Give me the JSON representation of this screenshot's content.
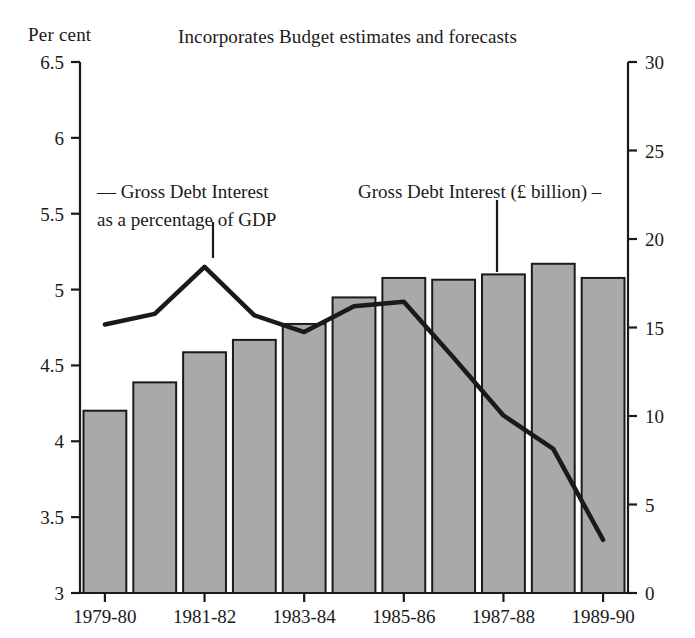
{
  "chart_data": {
    "type": "bar",
    "title": "Incorporates Budget estimates and forecasts",
    "ylabel": "Per cent",
    "xlabel": "",
    "grid": false,
    "legend_position": "inline-annotations",
    "categories": [
      "1979-80",
      "1980-81",
      "1981-82",
      "1982-83",
      "1983-84",
      "1984-85",
      "1985-86",
      "1986-87",
      "1987-88",
      "1988-89",
      "1989-90"
    ],
    "xtick_labels": [
      "1979-80",
      "1981-82",
      "1983-84",
      "1985-86",
      "1987-88",
      "1989-90"
    ],
    "xtick_indices": [
      0,
      2,
      4,
      6,
      8,
      10
    ],
    "left_axis": {
      "label": "Per cent",
      "ylim": [
        3,
        6.5
      ],
      "ticks": [
        3,
        3.5,
        4,
        4.5,
        5,
        5.5,
        6,
        6.5
      ],
      "tick_labels": [
        "3",
        "3.5",
        "4",
        "4.5",
        "5",
        "5.5",
        "6",
        "6.5"
      ]
    },
    "right_axis": {
      "label": "£ billion",
      "ylim": [
        0,
        30
      ],
      "ticks": [
        0,
        5,
        10,
        15,
        20,
        25,
        30
      ],
      "tick_labels": [
        "0",
        "5",
        "10",
        "15",
        "20",
        "25",
        "30"
      ]
    },
    "series": [
      {
        "name": "Gross Debt Interest (£ billion)",
        "type": "bar",
        "axis": "right",
        "values": [
          10.3,
          11.9,
          13.6,
          14.3,
          15.2,
          16.7,
          17.8,
          17.7,
          18.0,
          18.6,
          17.8
        ]
      },
      {
        "name": "Gross Debt Interest as a percentage of GDP",
        "type": "line",
        "axis": "left",
        "values": [
          4.77,
          4.84,
          5.15,
          4.83,
          4.72,
          4.89,
          4.92,
          4.55,
          4.17,
          3.95,
          3.35
        ]
      }
    ],
    "annotations": [
      {
        "id": "left",
        "lines": [
          "— Gross Debt Interest",
          "as a percentage of GDP"
        ]
      },
      {
        "id": "right",
        "lines": [
          "Gross Debt Interest (£ billion) –"
        ]
      }
    ],
    "colors": {
      "bar_fill": "#a9a9a9",
      "bar_stroke": "#1a1a1a",
      "line": "#1a1a1a",
      "axis": "#1a1a1a",
      "background": "#ffffff"
    }
  }
}
